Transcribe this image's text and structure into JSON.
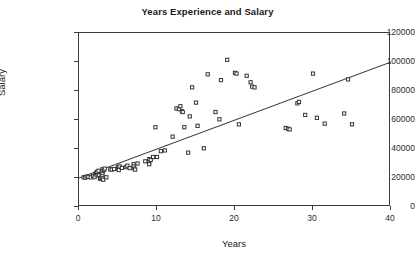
{
  "chart_data": {
    "type": "scatter",
    "title": "Years Experience and Salary",
    "xlabel": "Years",
    "ylabel": "Salary",
    "xlim": [
      0,
      40
    ],
    "ylim": [
      0,
      120000
    ],
    "xticks": [
      0,
      10,
      20,
      30,
      40
    ],
    "yticks": [
      0,
      20000,
      40000,
      60000,
      80000,
      100000,
      120000
    ],
    "xtick_labels": [
      "0",
      "10",
      "20",
      "30",
      "40"
    ],
    "ytick_labels": [
      "0",
      "20000",
      "40000",
      "60000",
      "80000",
      "100000",
      "120000"
    ],
    "grid": false,
    "legend": null,
    "marker": "open-square",
    "marker_color": "#333333",
    "series": [
      {
        "name": "Salary vs Years Experience",
        "points": [
          [
            0.6,
            20500
          ],
          [
            0.8,
            20200
          ],
          [
            1.0,
            21000
          ],
          [
            1.2,
            20800
          ],
          [
            1.5,
            20400
          ],
          [
            1.8,
            21500
          ],
          [
            2.0,
            20600
          ],
          [
            2.1,
            22500
          ],
          [
            2.2,
            23500
          ],
          [
            2.3,
            24200
          ],
          [
            2.4,
            21800
          ],
          [
            2.5,
            25000
          ],
          [
            2.6,
            22000
          ],
          [
            2.7,
            19500
          ],
          [
            2.8,
            20000
          ],
          [
            2.9,
            23000
          ],
          [
            3.0,
            26000
          ],
          [
            3.0,
            24500
          ],
          [
            3.0,
            22800
          ],
          [
            3.0,
            21200
          ],
          [
            3.0,
            19800
          ],
          [
            3.1,
            18800
          ],
          [
            3.2,
            25500
          ],
          [
            3.3,
            26500
          ],
          [
            3.5,
            20500
          ],
          [
            4.0,
            26000
          ],
          [
            4.2,
            25800
          ],
          [
            4.5,
            26200
          ],
          [
            5.0,
            27500
          ],
          [
            5.0,
            26500
          ],
          [
            5.1,
            25500
          ],
          [
            5.2,
            28000
          ],
          [
            5.5,
            27000
          ],
          [
            6.0,
            27500
          ],
          [
            6.2,
            28500
          ],
          [
            6.5,
            26800
          ],
          [
            7.0,
            29500
          ],
          [
            7.0,
            28000
          ],
          [
            7.1,
            26500
          ],
          [
            7.2,
            25800
          ],
          [
            7.5,
            30000
          ],
          [
            8.5,
            31500
          ],
          [
            9.0,
            33000
          ],
          [
            9.0,
            31000
          ],
          [
            9.0,
            29500
          ],
          [
            9.2,
            32500
          ],
          [
            9.5,
            34500
          ],
          [
            9.8,
            55000
          ],
          [
            10.0,
            34500
          ],
          [
            10.5,
            38500
          ],
          [
            11.0,
            39000
          ],
          [
            12.0,
            48500
          ],
          [
            12.5,
            68000
          ],
          [
            12.8,
            67500
          ],
          [
            13.0,
            69500
          ],
          [
            13.2,
            66000
          ],
          [
            13.3,
            65500
          ],
          [
            13.5,
            55000
          ],
          [
            14.0,
            37500
          ],
          [
            14.2,
            62500
          ],
          [
            14.5,
            82500
          ],
          [
            15.0,
            72000
          ],
          [
            15.2,
            56000
          ],
          [
            16.0,
            40500
          ],
          [
            16.5,
            91500
          ],
          [
            17.5,
            65500
          ],
          [
            18.0,
            60500
          ],
          [
            18.2,
            87500
          ],
          [
            19.0,
            101500
          ],
          [
            20.0,
            92500
          ],
          [
            20.2,
            92000
          ],
          [
            20.5,
            57000
          ],
          [
            21.5,
            90500
          ],
          [
            22.0,
            86000
          ],
          [
            22.2,
            83000
          ],
          [
            22.5,
            82500
          ],
          [
            26.5,
            54500
          ],
          [
            26.8,
            54000
          ],
          [
            27.0,
            53500
          ],
          [
            28.0,
            71500
          ],
          [
            28.2,
            72500
          ],
          [
            29.0,
            63500
          ],
          [
            30.0,
            92000
          ],
          [
            30.5,
            61500
          ],
          [
            31.5,
            57500
          ],
          [
            34.0,
            64500
          ],
          [
            34.5,
            88000
          ],
          [
            35.0,
            57000
          ]
        ]
      }
    ],
    "trendline": {
      "type": "linear-fit",
      "x_start": 0,
      "y_start": 20000,
      "x_end": 40,
      "y_end": 100000
    }
  }
}
